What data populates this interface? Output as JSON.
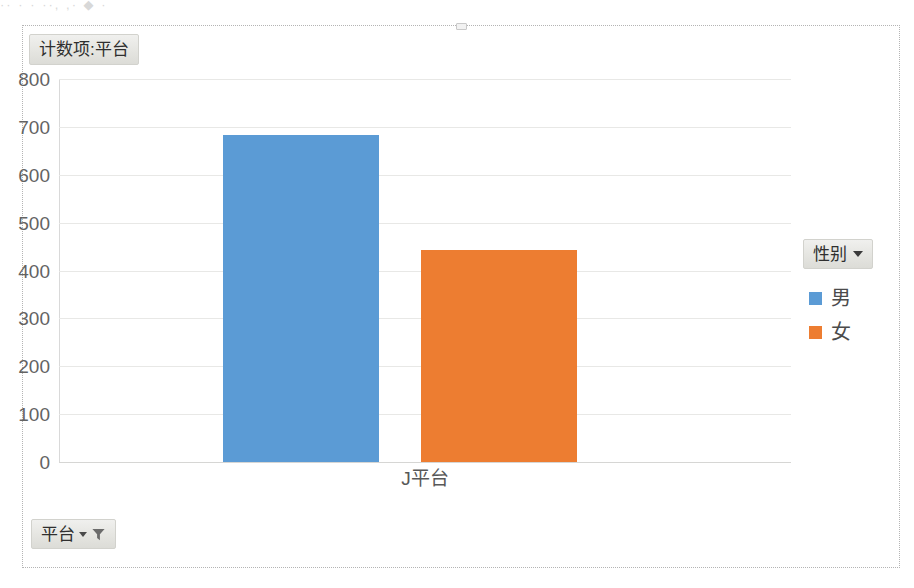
{
  "scan_artifact": "·· · ·   ··, ,· ◆ ·",
  "chart": {
    "title_button_label": "计数项:平台",
    "category_axis_label": "J平台",
    "axis_field_button_label": "平台",
    "legend_field_button_label": "性别",
    "icons": {
      "title_none": "none",
      "legend_caret": "chevron-down-icon",
      "axis_caret": "chevron-down-icon",
      "axis_filter": "filter-funnel-icon",
      "selection_handle": "resize-handle"
    }
  },
  "chart_data": {
    "type": "bar",
    "title": "计数项:平台",
    "categories": [
      "J平台"
    ],
    "series": [
      {
        "name": "男",
        "values": [
          684
        ],
        "color": "#5b9bd5"
      },
      {
        "name": "女",
        "values": [
          442
        ],
        "color": "#ed7d31"
      }
    ],
    "xlabel": "平台",
    "ylabel": "",
    "ylim": [
      0,
      800
    ],
    "ytick_step": 100,
    "yticks": [
      "800",
      "700",
      "600",
      "500",
      "400",
      "300",
      "200",
      "100",
      "0"
    ],
    "grid": true,
    "legend_position": "right",
    "legend_title": "性别"
  }
}
